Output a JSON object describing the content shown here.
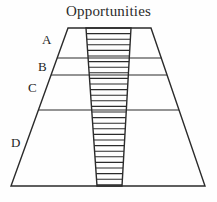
{
  "figure": {
    "title": "Opportunities",
    "background_color": "#fefefe",
    "line_color": "#2b2b2b",
    "label_color": "#1e1e1e"
  },
  "band_labels": [
    {
      "text": "A",
      "x": 42,
      "y": 33
    },
    {
      "text": "B",
      "x": 38,
      "y": 60
    },
    {
      "text": "C",
      "x": 28,
      "y": 81
    },
    {
      "text": "D",
      "x": 11,
      "y": 136
    }
  ],
  "chart_data": {
    "type": "diagram",
    "title": "Opportunities",
    "shape": "trapezoid",
    "outline": {
      "top_left": [
        68,
        28
      ],
      "top_right": [
        151,
        28
      ],
      "bottom_right": [
        205,
        186
      ],
      "bottom_left": [
        11,
        186
      ]
    },
    "bands": [
      {
        "label": "A",
        "top_y": 28,
        "bottom_y": 58
      },
      {
        "label": "B",
        "top_y": 58,
        "bottom_y": 75
      },
      {
        "label": "C",
        "top_y": 75,
        "bottom_y": 110
      },
      {
        "label": "D",
        "top_y": 110,
        "bottom_y": 186
      }
    ],
    "dividers_y": [
      58,
      75,
      110
    ],
    "hatched_column": {
      "top_left": [
        86,
        28
      ],
      "top_right": [
        131,
        28
      ],
      "bottom_right": [
        122,
        186
      ],
      "bottom_left": [
        97,
        186
      ],
      "hatch_orientation": "horizontal",
      "hatch_spacing": 5.6,
      "hatch_line_count": 28
    }
  }
}
